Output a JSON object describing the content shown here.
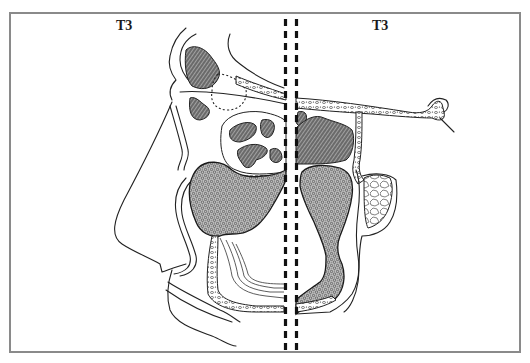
{
  "figure": {
    "panels": [
      {
        "id": "left",
        "label": "T3",
        "view": "sagittal"
      },
      {
        "id": "right",
        "label": "T3",
        "view": "coronal"
      }
    ],
    "divider": {
      "style": "double-dashed-vertical"
    },
    "colors": {
      "ink": "#222222",
      "border": "#8a8a8a",
      "background": "#ffffff"
    }
  }
}
